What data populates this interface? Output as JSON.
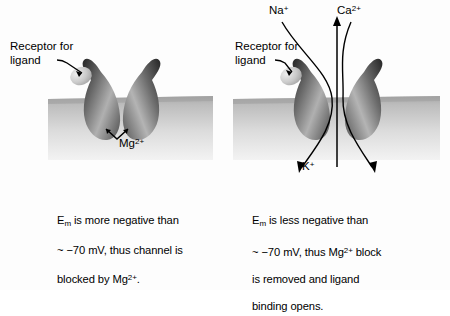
{
  "figure": {
    "background_color": "#fdfdfd",
    "membrane_color_top": "#b4b4b4",
    "membrane_color_bottom": "#ececec",
    "subunit_dark_color": "#3a3a3a",
    "subunit_light_color": "#d8d8d8",
    "line_color": "#000000"
  },
  "panels": [
    {
      "id": "closed",
      "state_name": "closed-blocked-channel",
      "receptor_label": {
        "line1": "Receptor for",
        "line2": "ligand"
      },
      "ion_label": {
        "text": "Mg",
        "charge": "2+"
      },
      "caption": {
        "line1_pre": "E",
        "line1_sub": "m",
        "line1_post": " is more negative than",
        "line2": "~ −70 mV, thus channel is",
        "line3_pre": "blocked by Mg",
        "line3_sup": "2+",
        "line3_post": "."
      }
    },
    {
      "id": "open",
      "state_name": "open-conducting-channel",
      "receptor_label": {
        "line1": "Receptor for",
        "line2": "ligand"
      },
      "ion_labels": {
        "sodium": {
          "text": "Na",
          "charge": "+"
        },
        "calcium": {
          "text": "Ca",
          "charge": "2+"
        },
        "potassium": {
          "text": "K",
          "charge": "+"
        }
      },
      "caption": {
        "line1_pre": "E",
        "line1_sub": "m",
        "line1_post": " is less negative than",
        "line2_pre": "~ −70 mV, thus Mg",
        "line2_sup": "2+",
        "line2_post": " block",
        "line3": "is removed and ligand",
        "line4": "binding opens."
      }
    }
  ]
}
